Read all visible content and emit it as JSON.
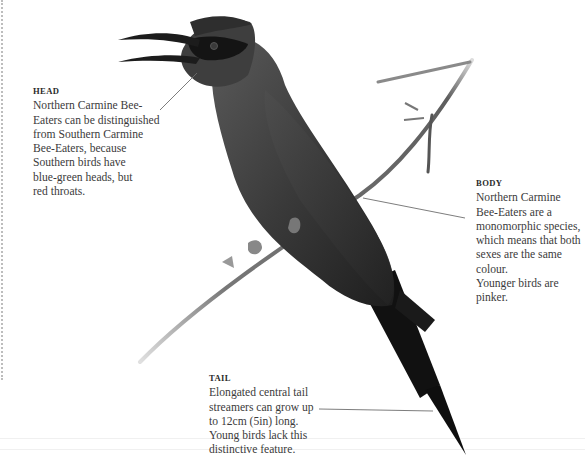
{
  "page": {
    "subject": "Northern Carmine Bee-Eater",
    "background": "#ffffff",
    "text_color": "#3b3b3b",
    "leader_line_color": "#6e6e6e"
  },
  "callouts": {
    "head": {
      "heading": "HEAD",
      "lines": [
        "Northern Carmine Bee-",
        "Eaters can be distinguished",
        "from Southern Carmine",
        "Bee-Eaters, because",
        "Southern birds have",
        "blue-green heads, but",
        "red throats."
      ]
    },
    "body": {
      "heading": "BODY",
      "lines": [
        "Northern Carmine",
        "Bee-Eaters are a",
        "monomorphic species,",
        "which means that both",
        "sexes are the same colour.",
        "Younger birds are pinker."
      ]
    },
    "tail": {
      "heading": "TAIL",
      "lines": [
        "Elongated central tail",
        "streamers can grow up",
        "to 12cm (5in) long.",
        "Young birds lack this",
        "distinctive feature."
      ]
    }
  },
  "illustration": {
    "name": "bee-eater-on-branch",
    "tones": {
      "body_dark": "#2b2b2b",
      "body_mid": "#4a4a4a",
      "cap": "#3c3c3c",
      "mask": "#151515",
      "beak": "#1c1c1c",
      "branch": "#6a6a6a",
      "tail": "#0e0e0e"
    }
  }
}
